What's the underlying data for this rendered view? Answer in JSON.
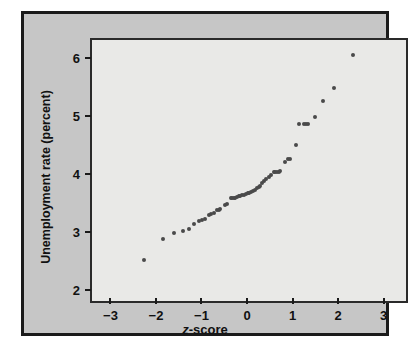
{
  "chart_data": {
    "type": "scatter",
    "title": "",
    "xlabel": "z-score",
    "ylabel": "Unemployment rate (percent)",
    "xlim": [
      -3.45,
      3.45
    ],
    "ylim": [
      1.85,
      6.35
    ],
    "xticks": [
      -3,
      -2,
      -1,
      0,
      1,
      2,
      3
    ],
    "xtick_labels": [
      "−3",
      "−2",
      "−1",
      "0",
      "1",
      "2",
      "3"
    ],
    "yticks": [
      2,
      3,
      4,
      5,
      6
    ],
    "ytick_labels": [
      "2",
      "3",
      "4",
      "5",
      "6"
    ],
    "grid": false,
    "legend": null,
    "series": [
      {
        "name": "Unemployment rate normal quantile plot",
        "marker": "filled-circle",
        "color": "#4a4a4a",
        "x": [
          -2.3,
          -1.88,
          -1.64,
          -1.46,
          -1.32,
          -1.2,
          -1.09,
          -1.03,
          -0.97,
          -0.88,
          -0.83,
          -0.78,
          -0.7,
          -0.67,
          -0.63,
          -0.52,
          -0.49,
          -0.4,
          -0.37,
          -0.34,
          -0.31,
          -0.27,
          -0.23,
          -0.19,
          -0.15,
          -0.11,
          -0.07,
          -0.03,
          0.01,
          0.05,
          0.09,
          0.13,
          0.17,
          0.21,
          0.25,
          0.29,
          0.34,
          0.38,
          0.43,
          0.48,
          0.54,
          0.57,
          0.61,
          0.65,
          0.69,
          0.8,
          0.85,
          0.9,
          1.03,
          1.1,
          1.2,
          1.25,
          1.3,
          1.46,
          1.62,
          1.86,
          2.29
        ],
        "y": [
          2.55,
          2.92,
          3.02,
          3.05,
          3.1,
          3.18,
          3.23,
          3.25,
          3.26,
          3.33,
          3.35,
          3.36,
          3.42,
          3.42,
          3.43,
          3.5,
          3.53,
          3.62,
          3.62,
          3.63,
          3.63,
          3.65,
          3.66,
          3.66,
          3.67,
          3.68,
          3.7,
          3.71,
          3.72,
          3.73,
          3.75,
          3.76,
          3.8,
          3.82,
          3.84,
          3.88,
          3.92,
          3.95,
          3.99,
          4.02,
          4.07,
          4.07,
          4.08,
          4.08,
          4.09,
          4.25,
          4.3,
          4.3,
          4.54,
          4.9,
          4.9,
          4.91,
          4.91,
          5.02,
          5.3,
          5.52,
          6.1
        ]
      }
    ]
  }
}
